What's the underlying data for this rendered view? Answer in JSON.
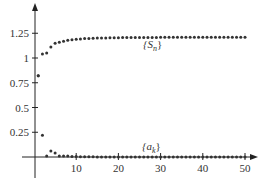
{
  "chart_data": {
    "type": "scatter",
    "title": "",
    "xlabel": "",
    "ylabel": "",
    "xlim": [
      0,
      52
    ],
    "ylim": [
      0,
      1.4
    ],
    "x_ticks": [
      10,
      20,
      30,
      40,
      50
    ],
    "y_ticks": [
      0.25,
      0.5,
      0.75,
      1,
      1.25
    ],
    "x_tick_labels": [
      "10",
      "20",
      "30",
      "40",
      "50"
    ],
    "y_tick_labels": [
      "0.25",
      "0.5",
      "0.75",
      "1",
      "1.25"
    ],
    "grid": false,
    "legend": null,
    "series": [
      {
        "name": "{S_n}",
        "label": "{S",
        "subscript": "n",
        "x": [
          1,
          2,
          3,
          4,
          5,
          6,
          7,
          8,
          9,
          10,
          11,
          12,
          13,
          14,
          15,
          16,
          17,
          18,
          19,
          20,
          21,
          22,
          23,
          24,
          25,
          26,
          27,
          28,
          29,
          30,
          31,
          32,
          33,
          34,
          35,
          36,
          37,
          38,
          39,
          40,
          41,
          42,
          43,
          44,
          45,
          46,
          47,
          48,
          49,
          50
        ],
        "values": [
          0.82,
          1.04,
          1.05,
          1.11,
          1.15,
          1.16,
          1.17,
          1.18,
          1.185,
          1.19,
          1.193,
          1.196,
          1.198,
          1.2,
          1.201,
          1.202,
          1.203,
          1.204,
          1.205,
          1.205,
          1.206,
          1.206,
          1.207,
          1.207,
          1.207,
          1.208,
          1.208,
          1.208,
          1.208,
          1.209,
          1.209,
          1.209,
          1.209,
          1.209,
          1.21,
          1.21,
          1.21,
          1.21,
          1.21,
          1.21,
          1.21,
          1.21,
          1.21,
          1.21,
          1.21,
          1.21,
          1.21,
          1.21,
          1.21,
          1.21
        ]
      },
      {
        "name": "{a_k}",
        "label": "{a",
        "subscript": "k",
        "x": [
          1,
          2,
          3,
          4,
          5,
          6,
          7,
          8,
          9,
          10,
          11,
          12,
          13,
          14,
          15,
          16,
          17,
          18,
          19,
          20,
          21,
          22,
          23,
          24,
          25,
          26,
          27,
          28,
          29,
          30,
          31,
          32,
          33,
          34,
          35,
          36,
          37,
          38,
          39,
          40,
          41,
          42,
          43,
          44,
          45,
          46,
          47,
          48,
          49,
          50
        ],
        "values": [
          0.82,
          0.22,
          0.01,
          0.06,
          0.04,
          0.01,
          0.01,
          0.01,
          0.005,
          0.005,
          0.003,
          0.003,
          0.002,
          0.002,
          0.001,
          0.001,
          0.001,
          0.001,
          0.001,
          0.0,
          0.0,
          0.0,
          0.0,
          0.0,
          0.0,
          0.0,
          0.0,
          0.0,
          0.0,
          0.0,
          0.0,
          0.0,
          0.0,
          0.0,
          0.0,
          0.0,
          0.0,
          0.0,
          0.0,
          0.0,
          0.0,
          0.0,
          0.0,
          0.0,
          0.0,
          0.0,
          0.0,
          0.0,
          0.0,
          0.0
        ]
      }
    ]
  },
  "labels": {
    "s_series": "{S",
    "s_sub": "n",
    "a_series": "{a",
    "a_sub": "k",
    "close_brace": "}"
  },
  "colors": {
    "axis": "#222222",
    "points": "#333333",
    "text": "#333333"
  }
}
